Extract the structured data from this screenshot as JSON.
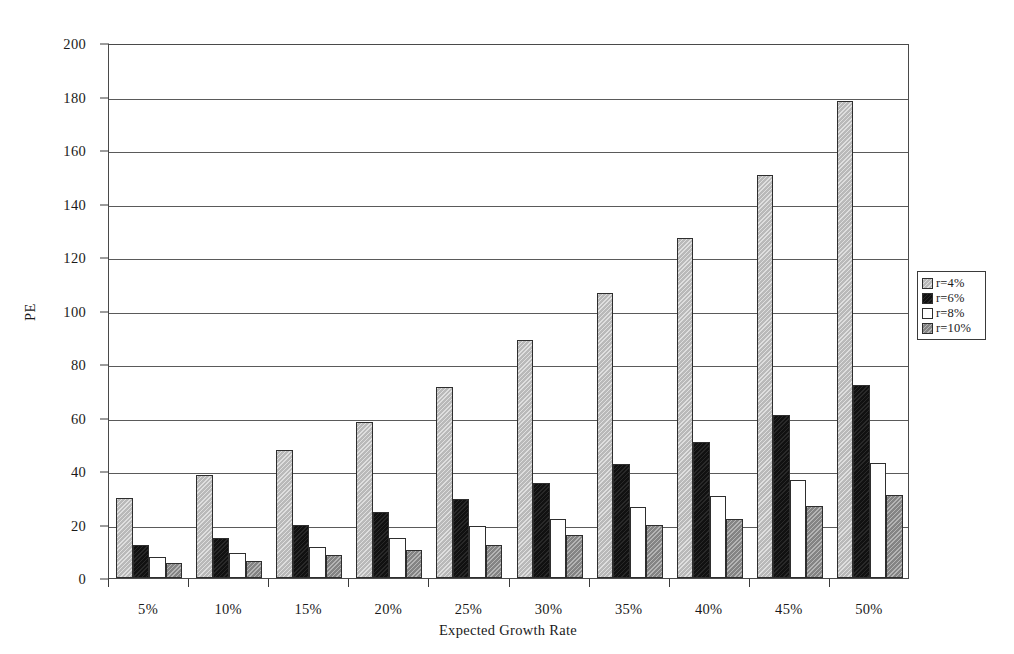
{
  "chart_data": {
    "type": "bar",
    "title": "",
    "xlabel": "Expected Growth Rate",
    "ylabel": "PE",
    "categories": [
      "5%",
      "10%",
      "15%",
      "20%",
      "25%",
      "30%",
      "35%",
      "40%",
      "45%",
      "50%"
    ],
    "series": [
      {
        "name": "r=4%",
        "color": "#b9b9b9",
        "values": [
          30,
          38.5,
          48,
          58.5,
          71.5,
          89,
          106.5,
          127,
          150.5,
          178.5
        ]
      },
      {
        "name": "r=6%",
        "color": "#111111",
        "values": [
          12.5,
          15,
          20,
          24.5,
          29.5,
          35.5,
          42.5,
          51,
          61,
          72
        ]
      },
      {
        "name": "r=8%",
        "color": "#ffffff",
        "values": [
          8,
          9.5,
          11.5,
          15,
          19.5,
          22,
          26.5,
          30.5,
          36.5,
          43
        ]
      },
      {
        "name": "r=10%",
        "color": "#848484",
        "values": [
          5.5,
          6.5,
          8.5,
          10.5,
          12.5,
          16,
          20,
          22,
          27,
          31
        ]
      }
    ],
    "ylim": [
      0,
      200
    ],
    "y_ticks": [
      0,
      20,
      40,
      60,
      80,
      100,
      120,
      140,
      160,
      180,
      200
    ],
    "grid": true,
    "legend_position": "right",
    "legend_entries": [
      "r=4%",
      "r=6%",
      "r=8%",
      "r=10%"
    ]
  }
}
